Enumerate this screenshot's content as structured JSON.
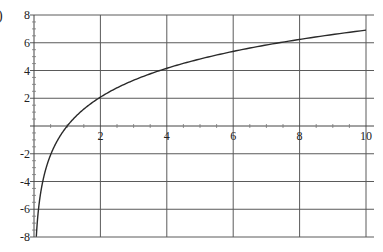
{
  "panel_label": ")",
  "chart_data": {
    "type": "line",
    "title": "",
    "xlabel": "",
    "ylabel": "",
    "xlim": [
      0,
      10
    ],
    "ylim": [
      -8,
      8
    ],
    "grid": true,
    "legend": null,
    "x_ticks": [
      2,
      4,
      6,
      8,
      10
    ],
    "x_tick_labels": [
      "2",
      "4",
      "6",
      "8",
      "10"
    ],
    "y_ticks": [
      8,
      6,
      4,
      2,
      -2,
      -4,
      -6,
      -8
    ],
    "y_tick_labels": [
      "8",
      "6",
      "4",
      "2",
      "-2",
      "-4",
      "-6",
      "-8"
    ],
    "series": [
      {
        "name": "y = 3 ln(x)",
        "x": [
          0.07,
          0.1,
          0.2,
          0.3,
          0.5,
          0.75,
          1,
          1.5,
          2,
          3,
          4,
          5,
          6,
          7,
          8,
          9,
          10
        ],
        "y": [
          -8.0,
          -6.91,
          -4.83,
          -3.61,
          -2.08,
          -0.86,
          0.0,
          1.22,
          2.08,
          3.3,
          4.16,
          4.83,
          5.38,
          5.84,
          6.24,
          6.59,
          6.91
        ]
      }
    ]
  }
}
